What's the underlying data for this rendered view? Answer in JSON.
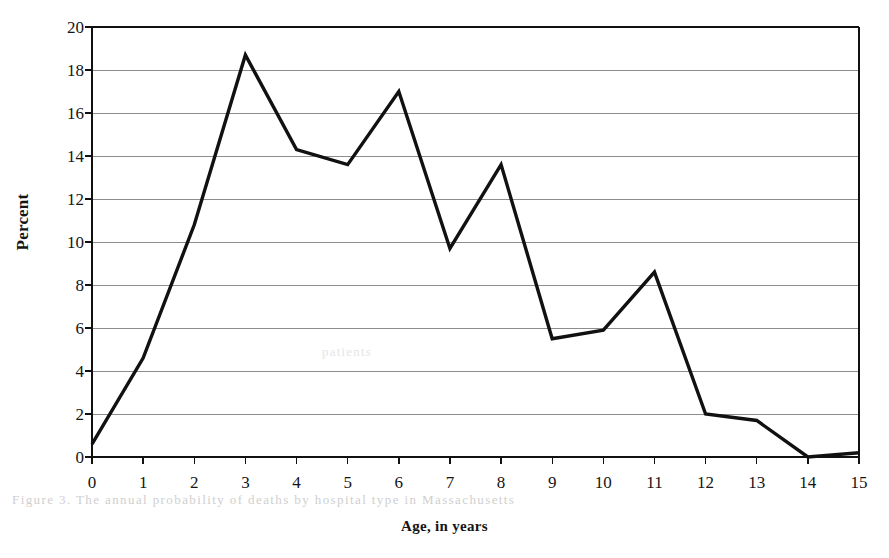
{
  "chart_data": {
    "type": "line",
    "title": "",
    "subtitle": "",
    "xlabel": "Age, in years",
    "ylabel": "Percent",
    "x": [
      0,
      1,
      2,
      3,
      4,
      5,
      6,
      7,
      8,
      9,
      10,
      11,
      12,
      13,
      14,
      15
    ],
    "values": [
      0.6,
      4.6,
      10.8,
      18.7,
      14.3,
      13.6,
      17.0,
      9.7,
      13.6,
      5.5,
      5.9,
      8.6,
      2.0,
      1.7,
      0.0,
      0.2
    ],
    "series": [
      {
        "name": "Percent",
        "values": [
          0.6,
          4.6,
          10.8,
          18.7,
          14.3,
          13.6,
          17.0,
          9.7,
          13.6,
          5.5,
          5.9,
          8.6,
          2.0,
          1.7,
          0.0,
          0.2
        ]
      }
    ],
    "xlim": [
      0,
      15
    ],
    "ylim": [
      0,
      20
    ],
    "ytick_labels": [
      "0",
      "2",
      "4",
      "6",
      "8",
      "10",
      "12",
      "14",
      "16",
      "18",
      "20"
    ],
    "ytick_values": [
      0,
      2,
      4,
      6,
      8,
      10,
      12,
      14,
      16,
      18,
      20
    ],
    "xtick_labels": [
      "0",
      "1",
      "2",
      "3",
      "4",
      "5",
      "6",
      "7",
      "8",
      "9",
      "10",
      "11",
      "12",
      "13",
      "14",
      "15"
    ],
    "xtick_values": [
      0,
      1,
      2,
      3,
      4,
      5,
      6,
      7,
      8,
      9,
      10,
      11,
      12,
      13,
      14,
      15
    ],
    "grid": "horizontal",
    "legend": "none",
    "line_color": "#111111",
    "grid_color": "#8d8d8d",
    "axis_color": "#111111",
    "background_color": "#ffffff"
  },
  "bleed_text": {
    "line_a": "Figure 3. The annual probability of deaths by hospital type in Massachusetts",
    "line_b": "patients"
  }
}
